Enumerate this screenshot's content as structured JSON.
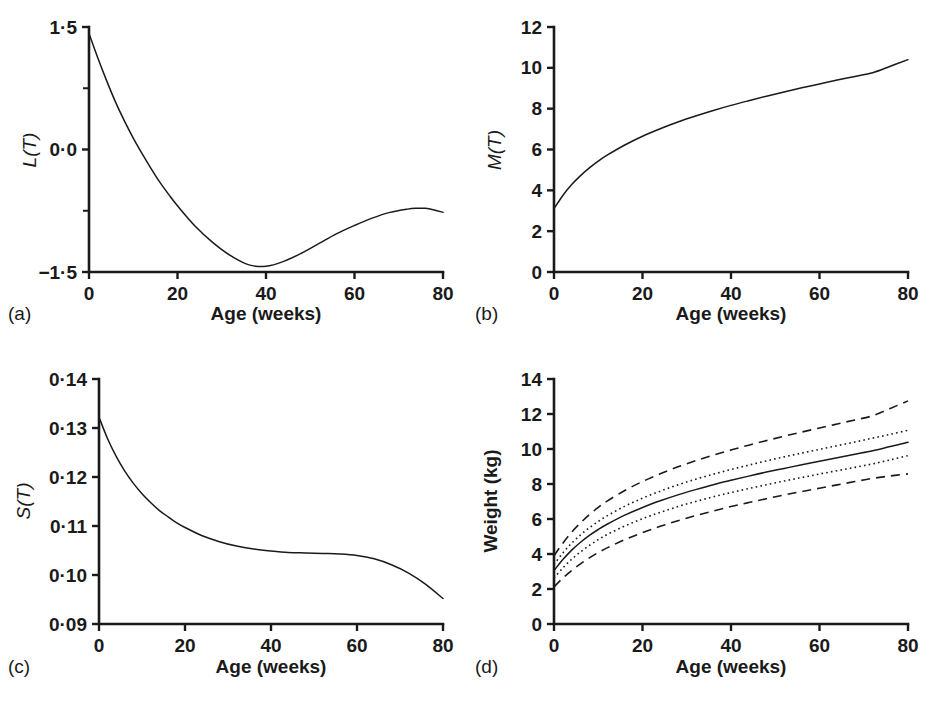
{
  "figure": {
    "background": "#ffffff",
    "ink": "#1a1a1a",
    "panel_count": 4
  },
  "chart_data": [
    {
      "id": "a",
      "type": "line",
      "panel_label": "(a)",
      "title": "",
      "xlabel": "Age (weeks)",
      "ylabel": "L(T)",
      "ylabel_style": "italic",
      "xlim": [
        0,
        80
      ],
      "ylim": [
        -1.5,
        1.5
      ],
      "xticks": [
        0,
        20,
        40,
        60,
        80
      ],
      "xticklabels": [
        "0",
        "20",
        "40",
        "60",
        "80"
      ],
      "yticks": [
        -1.5,
        0.0,
        1.5
      ],
      "yticklabels": [
        "−1·5",
        "0·0",
        "1·5"
      ],
      "yticks_minor": [
        -0.75,
        0.75
      ],
      "grid": false,
      "legend": "none",
      "series": [
        {
          "name": "L(T)",
          "style": "solid",
          "x": [
            0,
            2,
            4,
            6,
            8,
            10,
            12,
            14,
            16,
            18,
            20,
            24,
            28,
            32,
            36,
            40,
            44,
            48,
            52,
            56,
            60,
            64,
            68,
            72,
            74,
            76,
            78,
            80
          ],
          "y": [
            1.42,
            1.12,
            0.84,
            0.58,
            0.35,
            0.14,
            -0.05,
            -0.23,
            -0.4,
            -0.55,
            -0.69,
            -0.94,
            -1.14,
            -1.3,
            -1.41,
            -1.43,
            -1.37,
            -1.27,
            -1.15,
            -1.03,
            -0.93,
            -0.84,
            -0.77,
            -0.73,
            -0.72,
            -0.72,
            -0.74,
            -0.77
          ]
        }
      ]
    },
    {
      "id": "b",
      "type": "line",
      "panel_label": "(b)",
      "title": "",
      "xlabel": "Age (weeks)",
      "ylabel": "M(T)",
      "ylabel_style": "italic",
      "xlim": [
        0,
        80
      ],
      "ylim": [
        0,
        12
      ],
      "xticks": [
        0,
        20,
        40,
        60,
        80
      ],
      "xticklabels": [
        "0",
        "20",
        "40",
        "60",
        "80"
      ],
      "yticks": [
        0,
        2,
        4,
        6,
        8,
        10,
        12
      ],
      "yticklabels": [
        "0",
        "2",
        "4",
        "6",
        "8",
        "10",
        "12"
      ],
      "yticks_minor": [],
      "grid": false,
      "legend": "none",
      "series": [
        {
          "name": "M(T)",
          "style": "solid",
          "x": [
            0,
            2,
            4,
            6,
            8,
            10,
            12,
            16,
            20,
            24,
            28,
            32,
            36,
            40,
            44,
            48,
            52,
            56,
            60,
            64,
            68,
            72,
            76,
            80
          ],
          "y": [
            3.1,
            3.75,
            4.28,
            4.72,
            5.1,
            5.43,
            5.72,
            6.22,
            6.65,
            7.02,
            7.35,
            7.64,
            7.91,
            8.16,
            8.39,
            8.61,
            8.82,
            9.02,
            9.21,
            9.4,
            9.58,
            9.76,
            10.08,
            10.4
          ]
        }
      ]
    },
    {
      "id": "c",
      "type": "line",
      "panel_label": "(c)",
      "title": "",
      "xlabel": "Age (weeks)",
      "ylabel": "S(T)",
      "ylabel_style": "italic",
      "xlim": [
        0,
        80
      ],
      "ylim": [
        0.09,
        0.14
      ],
      "xticks": [
        0,
        20,
        40,
        60,
        80
      ],
      "xticklabels": [
        "0",
        "20",
        "40",
        "60",
        "80"
      ],
      "yticks": [
        0.09,
        0.1,
        0.11,
        0.12,
        0.13,
        0.14
      ],
      "yticklabels": [
        "0·09",
        "0·10",
        "0·11",
        "0·12",
        "0·13",
        "0·14"
      ],
      "yticks_minor": [],
      "grid": false,
      "legend": "none",
      "series": [
        {
          "name": "S(T)",
          "style": "solid",
          "x": [
            0,
            2,
            4,
            6,
            8,
            10,
            12,
            14,
            16,
            18,
            20,
            24,
            28,
            32,
            36,
            40,
            44,
            48,
            52,
            56,
            60,
            64,
            68,
            72,
            76,
            80
          ],
          "y": [
            0.1322,
            0.1278,
            0.1242,
            0.1212,
            0.1187,
            0.1166,
            0.1148,
            0.1132,
            0.1119,
            0.1107,
            0.1097,
            0.108,
            0.1068,
            0.1059,
            0.1053,
            0.1049,
            0.1046,
            0.1045,
            0.1044,
            0.1043,
            0.104,
            0.1033,
            0.1021,
            0.1004,
            0.0981,
            0.0952
          ]
        }
      ]
    },
    {
      "id": "d",
      "type": "line",
      "panel_label": "(d)",
      "title": "",
      "xlabel": "Age (weeks)",
      "ylabel": "Weight (kg)",
      "ylabel_style": "bold",
      "xlim": [
        0,
        80
      ],
      "ylim": [
        0,
        14
      ],
      "xticks": [
        0,
        20,
        40,
        60,
        80
      ],
      "xticklabels": [
        "0",
        "20",
        "40",
        "60",
        "80"
      ],
      "yticks": [
        0,
        2,
        4,
        6,
        8,
        10,
        12,
        14
      ],
      "yticklabels": [
        "0",
        "2",
        "4",
        "6",
        "8",
        "10",
        "12",
        "14"
      ],
      "yticks_minor": [],
      "grid": false,
      "legend": "none",
      "series": [
        {
          "name": "upper outer centile",
          "style": "dashed",
          "x": [
            0,
            2,
            4,
            6,
            8,
            10,
            12,
            16,
            20,
            24,
            28,
            32,
            36,
            40,
            44,
            48,
            52,
            56,
            60,
            64,
            68,
            72,
            76,
            80
          ],
          "y": [
            3.9,
            4.62,
            5.25,
            5.78,
            6.25,
            6.66,
            7.02,
            7.63,
            8.14,
            8.58,
            8.98,
            9.33,
            9.65,
            9.94,
            10.22,
            10.48,
            10.73,
            10.97,
            11.2,
            11.43,
            11.66,
            11.9,
            12.32,
            12.75
          ]
        },
        {
          "name": "upper inner centile",
          "style": "dotted",
          "x": [
            0,
            2,
            4,
            6,
            8,
            10,
            12,
            16,
            20,
            24,
            28,
            32,
            36,
            40,
            44,
            48,
            52,
            56,
            60,
            64,
            68,
            72,
            76,
            80
          ],
          "y": [
            3.4,
            4.06,
            4.62,
            5.09,
            5.5,
            5.86,
            6.18,
            6.73,
            7.19,
            7.59,
            7.95,
            8.27,
            8.56,
            8.83,
            9.08,
            9.32,
            9.55,
            9.77,
            9.98,
            10.19,
            10.4,
            10.62,
            10.84,
            11.07
          ]
        },
        {
          "name": "median",
          "style": "solid",
          "x": [
            0,
            2,
            4,
            6,
            8,
            10,
            12,
            16,
            20,
            24,
            28,
            32,
            36,
            40,
            44,
            48,
            52,
            56,
            60,
            64,
            68,
            72,
            76,
            80
          ],
          "y": [
            3.05,
            3.68,
            4.22,
            4.67,
            5.06,
            5.4,
            5.7,
            6.22,
            6.66,
            7.04,
            7.38,
            7.68,
            7.96,
            8.21,
            8.45,
            8.68,
            8.89,
            9.1,
            9.3,
            9.5,
            9.7,
            9.9,
            10.14,
            10.38
          ]
        },
        {
          "name": "lower inner centile",
          "style": "dotted",
          "x": [
            0,
            2,
            4,
            6,
            8,
            10,
            12,
            16,
            20,
            24,
            28,
            32,
            36,
            40,
            44,
            48,
            52,
            56,
            60,
            64,
            68,
            72,
            76,
            80
          ],
          "y": [
            2.62,
            3.2,
            3.7,
            4.12,
            4.49,
            4.82,
            5.11,
            5.6,
            6.02,
            6.38,
            6.71,
            7.0,
            7.27,
            7.51,
            7.74,
            7.96,
            8.17,
            8.37,
            8.57,
            8.76,
            8.95,
            9.15,
            9.38,
            9.62
          ]
        },
        {
          "name": "lower outer centile",
          "style": "dashed",
          "x": [
            0,
            2,
            4,
            6,
            8,
            10,
            12,
            16,
            20,
            24,
            28,
            32,
            36,
            40,
            44,
            48,
            52,
            56,
            60,
            64,
            68,
            72,
            76,
            80
          ],
          "y": [
            2.12,
            2.62,
            3.06,
            3.44,
            3.78,
            4.08,
            4.35,
            4.82,
            5.22,
            5.58,
            5.9,
            6.19,
            6.46,
            6.71,
            6.94,
            7.16,
            7.37,
            7.57,
            7.76,
            7.95,
            8.14,
            8.32,
            8.46,
            8.58
          ]
        }
      ]
    }
  ]
}
